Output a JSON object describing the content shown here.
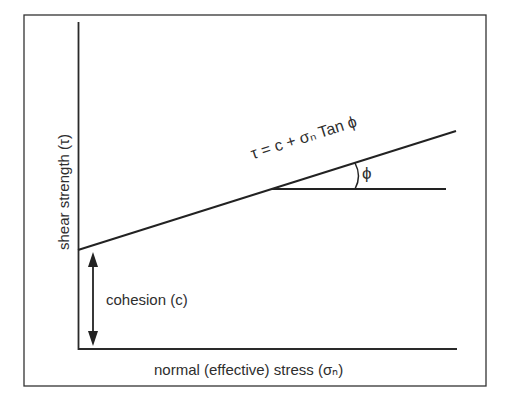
{
  "diagram": {
    "equation": "τ = c + σₙ Tan ϕ",
    "angle_label": "ϕ",
    "y_axis_label": "shear strength (τ)",
    "x_axis_label": "normal (effective) stress (σₙ)",
    "cohesion_label": "cohesion (c)",
    "colors": {
      "line": "#2a2a2a",
      "background": "#ffffff"
    }
  }
}
